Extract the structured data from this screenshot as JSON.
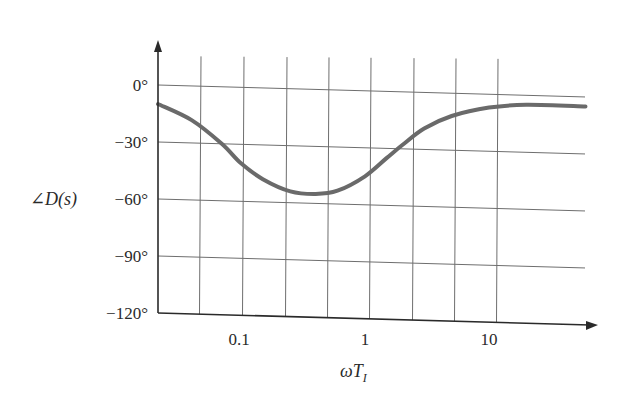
{
  "chart_data": {
    "type": "line",
    "title": "",
    "xlabel": "ωT_I",
    "ylabel": "∠D(s)",
    "x_scale": "log",
    "x_tick_labels": [
      "0.1",
      "1",
      "10"
    ],
    "x_tick_values": [
      0.1,
      1,
      10
    ],
    "y_tick_labels": [
      "0°",
      "−30°",
      "−60°",
      "−90°",
      "−120°"
    ],
    "y_tick_values": [
      0,
      -30,
      -60,
      -90,
      -120
    ],
    "ylim": [
      -120,
      20
    ],
    "xlim": [
      0.02,
      60
    ],
    "grid": true,
    "legend": null,
    "series": [
      {
        "name": "∠D(s)",
        "color": "#6a6a6a",
        "x": [
          0.02,
          0.04,
          0.07,
          0.1,
          0.15,
          0.25,
          0.4,
          0.6,
          1.0,
          1.5,
          2.0,
          3.0,
          5.0,
          10.0,
          20.0,
          60.0
        ],
        "y": [
          -10,
          -18,
          -30,
          -40,
          -48,
          -54,
          -55,
          -53,
          -45,
          -35,
          -28,
          -19,
          -12,
          -7,
          -5,
          -5
        ]
      }
    ],
    "colors": {
      "curve": "#6a6a6a",
      "grid": "#6e6e6e",
      "axis": "#2a2a2a",
      "text": "#2a2a2a"
    }
  },
  "axes": {
    "y_label_main": "∠D",
    "y_label_arg": "(s)",
    "x_label_omega": "ω",
    "x_label_T": "T",
    "x_label_sub": "I"
  }
}
